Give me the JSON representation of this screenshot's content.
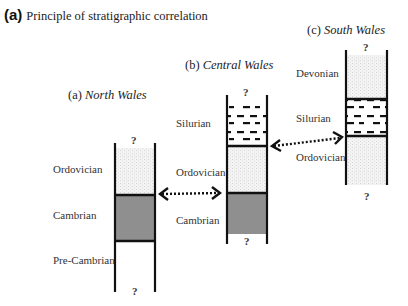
{
  "figure": {
    "panel_letter": "(a)",
    "title": "Principle of stratigraphic correlation"
  },
  "colors": {
    "gray_fill": "#8f8f8f",
    "stipple_fill": "#efefef",
    "line": "#111111"
  },
  "columns": [
    {
      "id": "north",
      "prefix": "(a)",
      "region": "North Wales",
      "top_mark": "?",
      "bottom_mark": "?",
      "units": [
        {
          "name": "Ordovician",
          "pattern": "stipple"
        },
        {
          "name": "Cambrian",
          "pattern": "gray"
        },
        {
          "name": "Pre-Cambrian",
          "pattern": "blank"
        }
      ]
    },
    {
      "id": "central",
      "prefix": "(b)",
      "region": "Central Wales",
      "top_mark": "?",
      "bottom_mark": "?",
      "units": [
        {
          "name": "Silurian",
          "pattern": "dashes"
        },
        {
          "name": "Ordovician",
          "pattern": "stipple"
        },
        {
          "name": "Cambrian",
          "pattern": "gray"
        }
      ]
    },
    {
      "id": "south",
      "prefix": "(c)",
      "region": "South Wales",
      "top_mark": "?",
      "bottom_mark": "?",
      "units": [
        {
          "name": "Devonian",
          "pattern": "stipple"
        },
        {
          "name": "Silurian",
          "pattern": "dashes"
        },
        {
          "name": "Ordovician",
          "pattern": "stipple"
        }
      ]
    }
  ],
  "correlations": [
    {
      "from": "North Wales Ordovician/Cambrian boundary",
      "to": "Central Wales Ordovician/Cambrian boundary",
      "style": "dotted double arrow"
    },
    {
      "from": "Central Wales Silurian/Ordovician boundary",
      "to": "South Wales Silurian/Ordovician boundary",
      "style": "dotted double arrow"
    }
  ]
}
